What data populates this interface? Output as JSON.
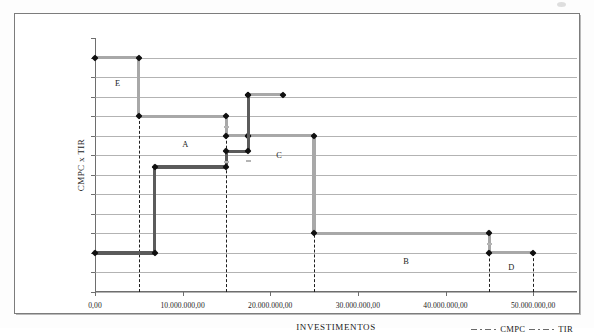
{
  "chart_data": {
    "type": "line",
    "title": "",
    "xlabel": "INVESTIMENTOS",
    "ylabel": "CMPC x TIR",
    "xlim": [
      0,
      55000000
    ],
    "ylim": [
      0.125,
      0.19
    ],
    "grid": true,
    "legend_position": "bottom-right",
    "ytick_labels": [
      "19,00%",
      "18,50%",
      "18,00%",
      "17,50%",
      "17,00%",
      "16,50%",
      "16,00%",
      "15,50%",
      "15,00%",
      "14,50%",
      "14,00%",
      "13,50%",
      "13,00%",
      "12,50%"
    ],
    "ytick_values": [
      0.19,
      0.185,
      0.18,
      0.175,
      0.17,
      0.165,
      0.16,
      0.155,
      0.15,
      0.145,
      0.14,
      0.135,
      0.13,
      0.125
    ],
    "xtick_labels": [
      "0,00",
      "10.000.000,00",
      "20.000.000,00",
      "30.000.000,00",
      "40.000.000,00",
      "50.000.000,00"
    ],
    "xtick_values": [
      0,
      10000000,
      20000000,
      30000000,
      40000000,
      50000000
    ],
    "series": [
      {
        "name": "TIR",
        "color": "#a8a8a8",
        "style": "step-decreasing",
        "points": [
          {
            "x": 0,
            "y": 0.185
          },
          {
            "x": 5000000,
            "y": 0.185
          },
          {
            "x": 5000000,
            "y": 0.17
          },
          {
            "x": 15000000,
            "y": 0.17
          },
          {
            "x": 15000000,
            "y": 0.165
          },
          {
            "x": 17500000,
            "y": 0.165
          },
          {
            "x": 17500000,
            "y": 0.1755
          },
          {
            "x": 21500000,
            "y": 0.1755
          },
          {
            "x": 17500000,
            "y": 0.165
          },
          {
            "x": 25000000,
            "y": 0.165
          },
          {
            "x": 25000000,
            "y": 0.14
          },
          {
            "x": 45000000,
            "y": 0.14
          },
          {
            "x": 45000000,
            "y": 0.135
          },
          {
            "x": 50000000,
            "y": 0.135
          }
        ]
      },
      {
        "name": "CMPC",
        "color": "#5b5b5b",
        "style": "step-increasing",
        "points": [
          {
            "x": 0,
            "y": 0.135
          },
          {
            "x": 6800000,
            "y": 0.135
          },
          {
            "x": 6800000,
            "y": 0.157
          },
          {
            "x": 15000000,
            "y": 0.157
          },
          {
            "x": 15000000,
            "y": 0.161
          },
          {
            "x": 17500000,
            "y": 0.161
          },
          {
            "x": 17500000,
            "y": 0.1755
          }
        ]
      }
    ],
    "reference_lines": [
      {
        "x": 5000000
      },
      {
        "x": 15000000
      },
      {
        "x": 25000000
      },
      {
        "x": 45000000
      },
      {
        "x": 50000000
      }
    ],
    "annotations": [
      {
        "label": "E",
        "x": 2600000,
        "y": 0.1785
      },
      {
        "label": "A",
        "x": 10300000,
        "y": 0.163
      },
      {
        "label": "C",
        "x": 21000000,
        "y": 0.16
      },
      {
        "label": "B",
        "x": 35500000,
        "y": 0.133
      },
      {
        "label": "D",
        "x": 47500000,
        "y": 0.1315
      }
    ],
    "legend": [
      {
        "label": "CMPC",
        "color": "#6a6a6a",
        "dash": "dash-dot"
      },
      {
        "label": "TIR",
        "color": "#6a6a6a",
        "dash": "dash-dot"
      }
    ]
  }
}
